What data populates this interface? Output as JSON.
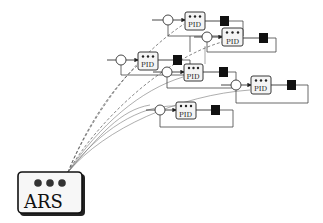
{
  "diagram": {
    "controller": {
      "label": "ARS",
      "indicator_dots": 3
    },
    "pid_label": "PID",
    "loops": [
      {
        "id": 1,
        "label": "PID"
      },
      {
        "id": 2,
        "label": "PID"
      },
      {
        "id": 3,
        "label": "PID"
      },
      {
        "id": 4,
        "label": "PID"
      },
      {
        "id": 5,
        "label": "PID"
      },
      {
        "id": 6,
        "label": "PID"
      }
    ],
    "colors": {
      "line": "#333333",
      "plant": "#111111",
      "background": "#ffffff"
    }
  }
}
